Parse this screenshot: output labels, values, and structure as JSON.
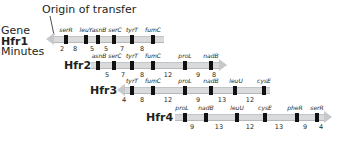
{
  "figure": {
    "origin_label": "Origin of transfer",
    "row_labels": {
      "gene": "Gene",
      "minutes": "Minutes"
    },
    "colors": {
      "bar": "#d9dadb",
      "marker": "#111111",
      "arrow": "#c7c8ca",
      "text": "#231f20"
    }
  },
  "strains": [
    {
      "name": "Hfr1",
      "direction": "left",
      "genes": [
        "serR",
        "leuY",
        "asnB",
        "serC",
        "tyrT",
        "fumC"
      ],
      "minutes": [
        "2",
        "8",
        "5",
        "5",
        "7",
        "8"
      ]
    },
    {
      "name": "Hfr2",
      "direction": "right",
      "genes": [
        "asnB",
        "serC",
        "tyrT",
        "fumC",
        "proL",
        "nadB"
      ],
      "minutes": [
        "5",
        "7",
        "8",
        "12",
        "9",
        "8"
      ]
    },
    {
      "name": "Hfr3",
      "direction": "left",
      "genes": [
        "tyrT",
        "fumC",
        "proL",
        "nadB",
        "leuU",
        "cysE"
      ],
      "minutes": [
        "4",
        "8",
        "12",
        "9",
        "13",
        "12"
      ]
    },
    {
      "name": "Hfr4",
      "direction": "right",
      "genes": [
        "proL",
        "nadB",
        "leuU",
        "cysE",
        "pheR",
        "serR"
      ],
      "minutes": [
        "9",
        "13",
        "12",
        "13",
        "9",
        "4"
      ]
    }
  ]
}
